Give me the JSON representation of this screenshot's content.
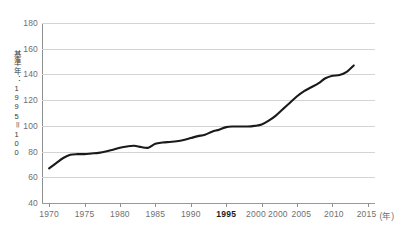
{
  "chart_data": {
    "type": "line",
    "title": "",
    "subtitle": "",
    "xlabel": "",
    "ylabel": "基準年：1995＝100",
    "x_unit_label": "(年)",
    "xlim": [
      1969,
      2016
    ],
    "ylim": [
      40,
      180
    ],
    "y_ticks": [
      180,
      160,
      140,
      120,
      100,
      80,
      60,
      40
    ],
    "y_tick_labels": [
      "180",
      "160",
      "140",
      "120",
      "100",
      "80",
      "60",
      "40"
    ],
    "x_ticks": [
      1970,
      1975,
      1980,
      1985,
      1990,
      1995,
      2000,
      2005,
      2010,
      2015
    ],
    "x_tick_labels": [
      "1970",
      "1975",
      "1980",
      "1985",
      "1990",
      "1995",
      "2000",
      "2000",
      "2005",
      "2010",
      "2015"
    ],
    "x_tick_label_positions": [
      1970,
      1975,
      1980,
      1985,
      1990,
      1995,
      1999.2,
      2002.3,
      2005.6,
      2010.2,
      2014.8
    ],
    "emphasized_x_tick_label": "1995",
    "grid": "horizontal",
    "legend": "none",
    "line_color": "#1a1a1a",
    "gridline_color": "#d4d4d4",
    "axis_color": "#8f8f8f",
    "background_color": "#ffffff",
    "series": [
      {
        "name": "index",
        "x": [
          1970,
          1971,
          1972,
          1973,
          1974,
          1975,
          1976,
          1977,
          1978,
          1979,
          1980,
          1981,
          1982,
          1983,
          1984,
          1985,
          1986,
          1987,
          1988,
          1989,
          1990,
          1991,
          1992,
          1993,
          1994,
          1995,
          1996,
          1997,
          1998,
          1999,
          2000,
          2001,
          2002,
          2003,
          2004,
          2005,
          2006,
          2007,
          2008,
          2009,
          2010,
          2011,
          2012,
          2013
        ],
        "values": [
          67,
          71,
          75,
          77.5,
          78,
          78,
          78.5,
          79,
          80,
          81.5,
          83,
          84,
          84.5,
          83.5,
          83,
          86,
          87,
          87.5,
          88,
          89,
          90.5,
          92,
          93,
          95.5,
          97,
          99,
          99.5,
          99.5,
          99.5,
          100,
          101,
          104,
          108,
          113,
          118,
          123,
          127,
          130,
          133,
          137,
          139,
          139.5,
          142,
          147
        ]
      }
    ]
  }
}
